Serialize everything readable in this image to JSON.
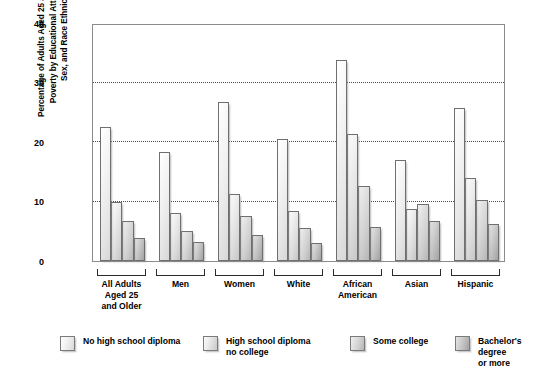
{
  "chart_data": {
    "type": "bar",
    "title": "",
    "ylabel": "Percentage of Adults Aged 25 and Older in Poverty by Educational Attainment, Sex, and Race Ethnicity",
    "ylabel_lines": [
      "Percentage of Adults Aged 25 and Older in",
      "Poverty by Educational Attainment,",
      "Sex, and Race Ethnicity"
    ],
    "xlabel": "",
    "ylim": [
      0,
      40
    ],
    "yticks": [
      0,
      10,
      20,
      30,
      40
    ],
    "ytick_labels": [
      "0",
      "10",
      "20",
      "30",
      "40"
    ],
    "grid": "horizontal-dotted",
    "legend_position": "bottom",
    "categories": [
      "All Adults Aged 25 and Older",
      "Men",
      "Women",
      "White",
      "African American",
      "Asian",
      "Hispanic"
    ],
    "category_label_lines": [
      [
        "All Adults",
        "Aged 25",
        "and Older"
      ],
      [
        "Men"
      ],
      [
        "Women"
      ],
      [
        "White"
      ],
      [
        "African",
        "American"
      ],
      [
        "Asian"
      ],
      [
        "Hispanic"
      ]
    ],
    "series": [
      {
        "name": "No high school diploma",
        "legend_lines": [
          "No high school diploma"
        ],
        "color": "#ececec",
        "values": [
          22.6,
          18.4,
          26.8,
          20.5,
          33.8,
          17.0,
          25.7
        ]
      },
      {
        "name": "High school diploma no college",
        "legend_lines": [
          "High school diploma",
          "no college"
        ],
        "color": "#dcdcdc",
        "values": [
          10.0,
          8.1,
          11.2,
          8.4,
          21.3,
          8.8,
          14.0
        ]
      },
      {
        "name": "Some college",
        "legend_lines": [
          "Some college"
        ],
        "color": "#cdcdcd",
        "values": [
          6.7,
          5.0,
          7.5,
          5.6,
          12.6,
          9.5,
          10.2
        ]
      },
      {
        "name": "Bachelor's degree or more",
        "legend_lines": [
          "Bachelor's degree",
          "or more"
        ],
        "color": "#b5b5b5",
        "values": [
          3.9,
          3.2,
          4.4,
          3.1,
          5.8,
          6.8,
          6.3
        ]
      }
    ]
  },
  "axis": {
    "frame_color": "#8b8b8b",
    "grid_color": "#4a4a4a"
  }
}
